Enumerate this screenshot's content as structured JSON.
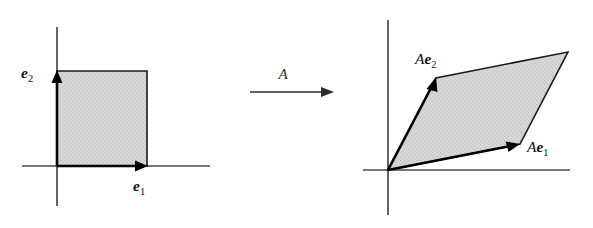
{
  "figure": {
    "background_color": "#ffffff",
    "fill_color": "#d2d2d2",
    "outline_color": "#1a1a1a",
    "axis_color": "#4a4a4a",
    "vector_color": "#000000"
  },
  "transformation": {
    "operator_label": "A",
    "arrow_direction": "right"
  },
  "left_panel": {
    "name": "unit square domain",
    "region_label": "unit square",
    "origin": {
      "x": 57,
      "y": 166
    },
    "axes": {
      "x_axis": {
        "x1": 22,
        "y1": 166,
        "x2": 210,
        "y2": 166
      },
      "y_axis": {
        "x1": 57,
        "y1": 27,
        "x2": 57,
        "y2": 206
      }
    },
    "square_vertices": [
      {
        "x": 57,
        "y": 166
      },
      {
        "x": 147,
        "y": 166
      },
      {
        "x": 147,
        "y": 71
      },
      {
        "x": 57,
        "y": 71
      }
    ],
    "vectors": [
      {
        "id": "e1",
        "label_operator": "",
        "label_vector": "e",
        "label_subscript": "1",
        "tail": {
          "x": 57,
          "y": 166
        },
        "tip": {
          "x": 145,
          "y": 166
        },
        "label_position": {
          "x": 133,
          "y": 189
        }
      },
      {
        "id": "e2",
        "label_operator": "",
        "label_vector": "e",
        "label_subscript": "2",
        "tail": {
          "x": 57,
          "y": 166
        },
        "tip": {
          "x": 57,
          "y": 73
        },
        "label_position": {
          "x": 22,
          "y": 72
        }
      }
    ]
  },
  "right_panel": {
    "name": "image parallelogram",
    "region_label": "image parallelogram",
    "origin": {
      "x": 388,
      "y": 170
    },
    "axes": {
      "x_axis": {
        "x1": 363,
        "y1": 170,
        "x2": 570,
        "y2": 170
      },
      "y_axis": {
        "x1": 388,
        "y1": 20,
        "x2": 388,
        "y2": 215
      }
    },
    "parallelogram_vertices": [
      {
        "x": 388,
        "y": 170
      },
      {
        "x": 520,
        "y": 144
      },
      {
        "x": 568,
        "y": 52
      },
      {
        "x": 436,
        "y": 78
      }
    ],
    "vectors": [
      {
        "id": "Ae1",
        "label_operator": "A",
        "label_vector": "e",
        "label_subscript": "1",
        "tail": {
          "x": 388,
          "y": 170
        },
        "tip": {
          "x": 516,
          "y": 145
        },
        "label_position": {
          "x": 526,
          "y": 152
        }
      },
      {
        "id": "Ae2",
        "label_operator": "A",
        "label_vector": "e",
        "label_subscript": "2",
        "tail": {
          "x": 388,
          "y": 170
        },
        "tip": {
          "x": 434,
          "y": 80
        },
        "label_position": {
          "x": 416,
          "y": 62
        }
      }
    ]
  },
  "map_arrow": {
    "line": {
      "x1": 250,
      "y1": 92,
      "x2": 330,
      "y2": 92
    },
    "label_position": {
      "x": 283,
      "y": 78
    }
  }
}
